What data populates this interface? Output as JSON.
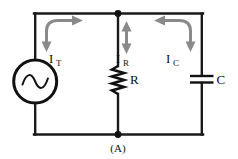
{
  "figure": {
    "caption": "(A)",
    "type": "ac-parallel-rc-circuit"
  },
  "colors": {
    "wire": "#1a1a1a",
    "arrow": "#8a8a8a",
    "text": "#111111",
    "background": "#ffffff"
  },
  "labels": {
    "total_current": "I",
    "total_current_sub": "T",
    "resistor_current": "I",
    "resistor_current_sub": "R",
    "capacitor_current": "I",
    "capacitor_current_sub": "C",
    "resistor": "R",
    "capacitor": "C"
  },
  "components": {
    "source": {
      "name": "ac-voltage-source",
      "symbol": "sine-wave-in-circle"
    },
    "resistor": {
      "name": "resistor",
      "symbol": "zigzag",
      "label": "R"
    },
    "capacitor": {
      "name": "capacitor",
      "symbol": "parallel-plates",
      "label": "C"
    }
  },
  "currents": [
    {
      "name": "I_T",
      "label": "I",
      "subscript": "T",
      "arrow": "curved-double-head-left-branch"
    },
    {
      "name": "I_R",
      "label": "I",
      "subscript": "R",
      "arrow": "vertical-double-head"
    },
    {
      "name": "I_C",
      "label": "I",
      "subscript": "C",
      "arrow": "curved-double-head-right-branch"
    }
  ]
}
